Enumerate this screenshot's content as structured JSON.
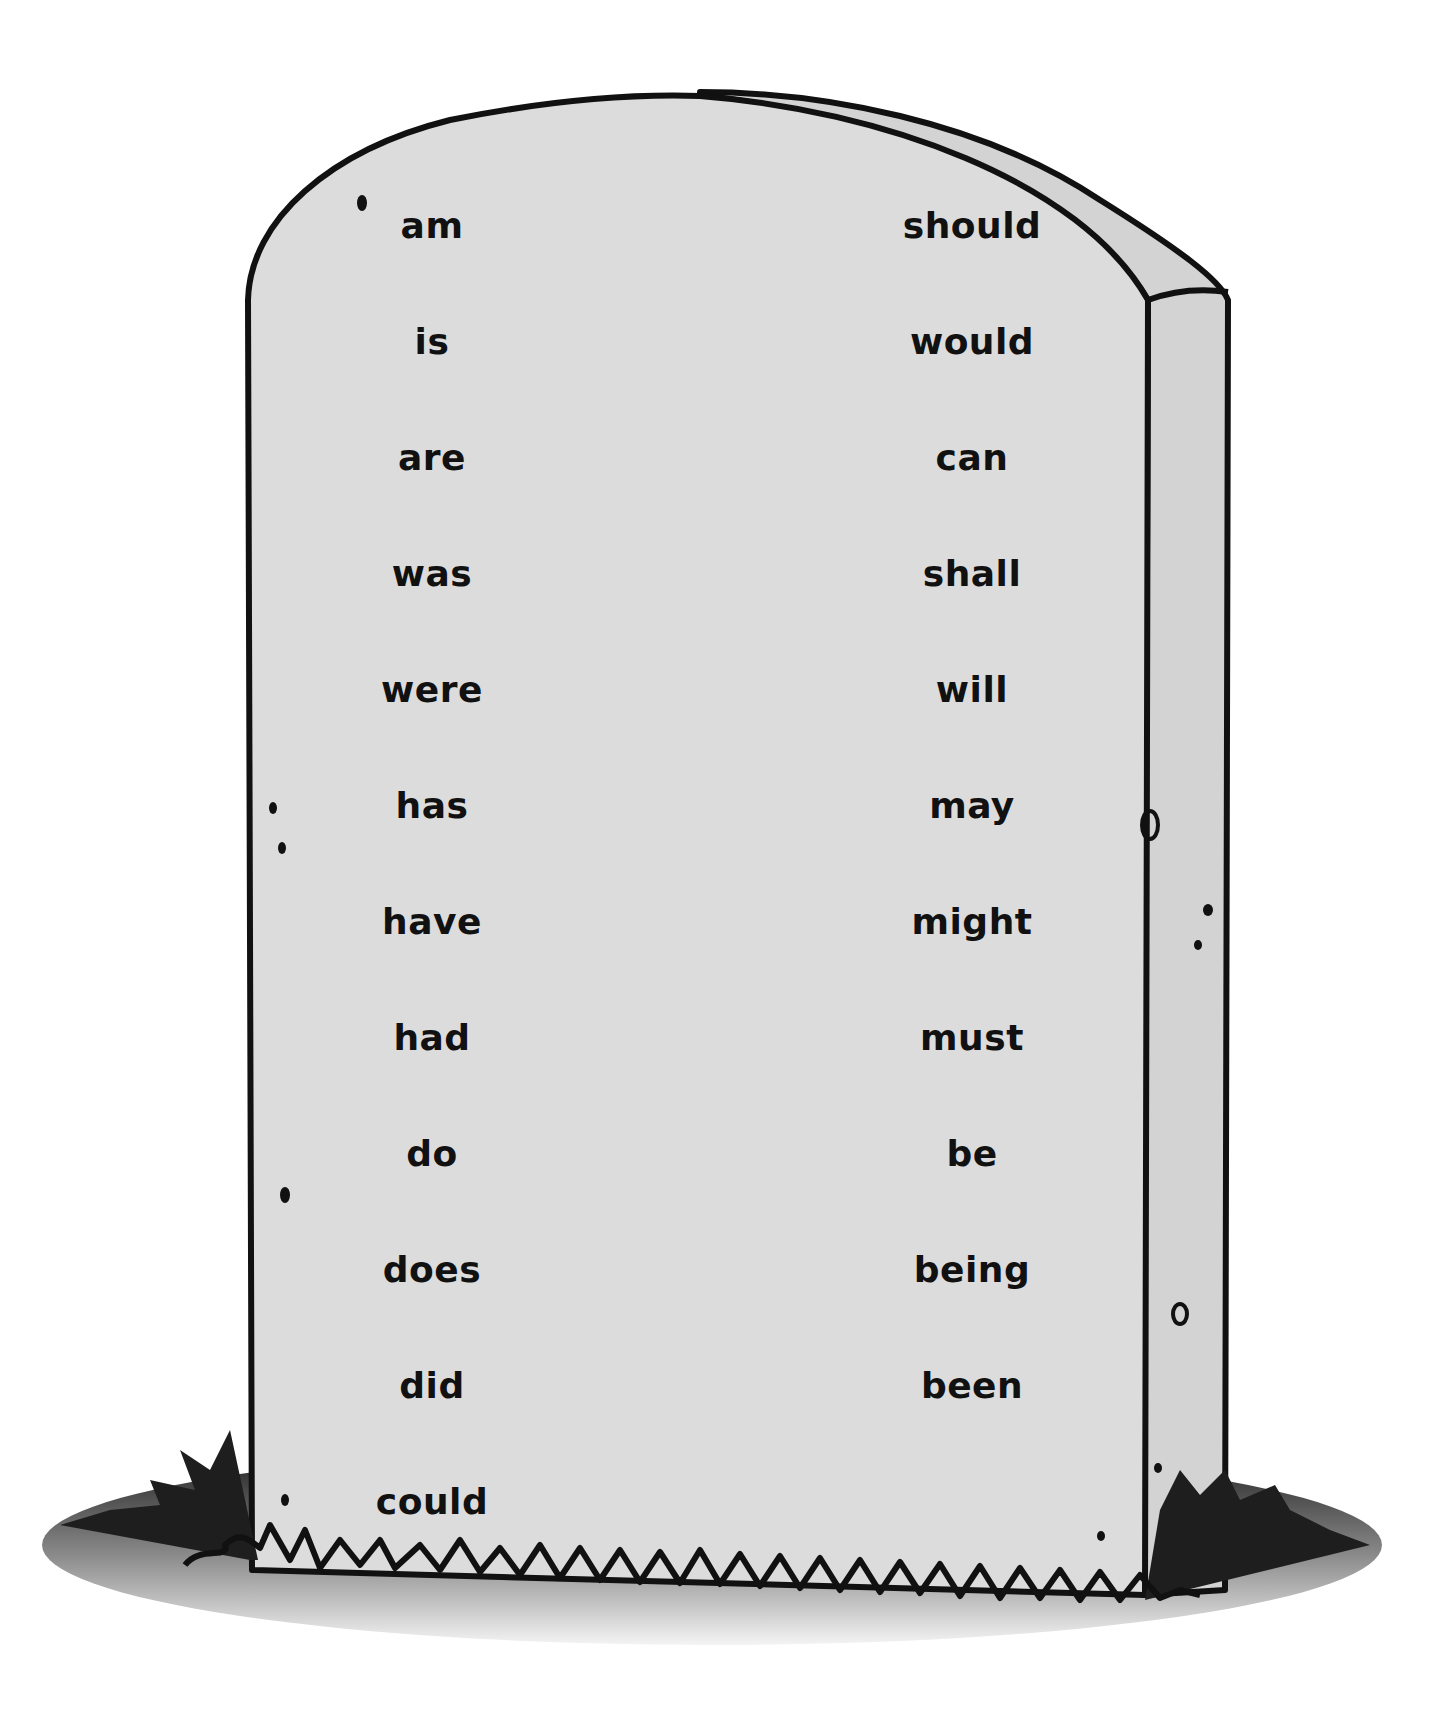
{
  "colors": {
    "stone_front": "#dcdcdc",
    "stone_side": "#d2d2d2",
    "outline": "#111111",
    "grass_dark": "#222222",
    "ground_light": "#e6e6e6"
  },
  "left_column": [
    "am",
    "is",
    "are",
    "was",
    "were",
    "has",
    "have",
    "had",
    "do",
    "does",
    "did",
    "could"
  ],
  "right_column": [
    "should",
    "would",
    "can",
    "shall",
    "will",
    "may",
    "might",
    "must",
    "be",
    "being",
    "been"
  ]
}
